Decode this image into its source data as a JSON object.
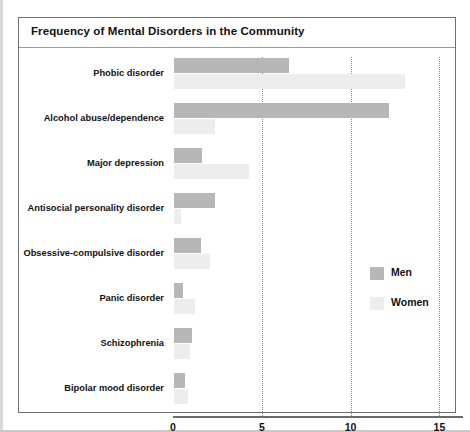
{
  "figure": {
    "title": "Frequency of Mental Disorders in the Community"
  },
  "legend": {
    "position": "right-middle",
    "items": [
      {
        "label": "Men",
        "color": "#b7b7b7"
      },
      {
        "label": "Women",
        "color": "#ededed"
      }
    ]
  },
  "axis": {
    "ticks": [
      "0",
      "5",
      "10",
      "15"
    ],
    "tick_values": [
      0,
      5,
      10,
      15
    ]
  },
  "chart_data": {
    "type": "bar",
    "orientation": "horizontal",
    "title": "Frequency of Mental Disorders in the Community",
    "xlabel": "",
    "ylabel": "",
    "xlim": [
      0,
      15
    ],
    "xticks": [
      0,
      5,
      10,
      15
    ],
    "grid": "vertical-dotted",
    "legend_position": "right-middle",
    "categories": [
      "Phobic disorder",
      "Alcohol abuse/dependence",
      "Major depression",
      "Antisocial personality disorder",
      "Obsessive-compulsive disorder",
      "Panic disorder",
      "Schizophrenia",
      "Bipolar mood disorder"
    ],
    "series": [
      {
        "name": "Men",
        "color": "#b7b7b7",
        "values": [
          6.5,
          12.1,
          1.6,
          2.3,
          1.5,
          0.5,
          1.0,
          0.6
        ]
      },
      {
        "name": "Women",
        "color": "#ededed",
        "values": [
          13.0,
          2.3,
          4.2,
          0.4,
          2.0,
          1.2,
          0.9,
          0.8
        ]
      }
    ]
  }
}
